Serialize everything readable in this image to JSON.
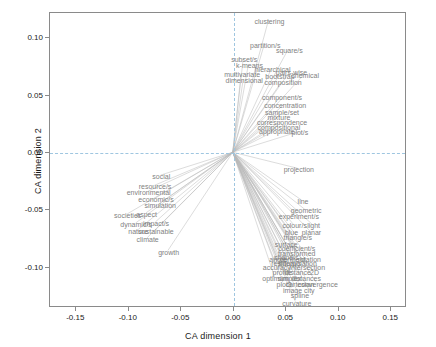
{
  "chart_data": {
    "type": "scatter",
    "title": "",
    "xlabel": "CA dimension 1",
    "ylabel": "CA dimension 2",
    "xlim": [
      -0.175,
      0.165
    ],
    "ylim": [
      -0.135,
      0.122
    ],
    "xticks": [
      "-0.15",
      "-0.10",
      "-0.05",
      "0.00",
      "0.05",
      "0.10",
      "0.15"
    ],
    "xtick_values": [
      -0.15,
      -0.1,
      -0.05,
      0.0,
      0.05,
      0.1,
      0.15
    ],
    "yticks": [
      "-0.10",
      "-0.05",
      "0.00",
      "0.05",
      "0.10"
    ],
    "ytick_values": [
      -0.1,
      -0.05,
      0.0,
      0.05,
      0.1
    ],
    "grid": "dashed-at-zero",
    "legend": "none",
    "origin": [
      0.0,
      0.0
    ],
    "points": [
      {
        "label": "clustering",
        "x": 0.034,
        "y": 0.115
      },
      {
        "label": "partition/s",
        "x": 0.03,
        "y": 0.094
      },
      {
        "label": "square/s",
        "x": 0.053,
        "y": 0.09
      },
      {
        "label": "subset/s",
        "x": 0.01,
        "y": 0.082
      },
      {
        "label": "k-means",
        "x": 0.015,
        "y": 0.077
      },
      {
        "label": "hierarchical",
        "x": 0.037,
        "y": 0.073
      },
      {
        "label": "pairs-wise",
        "x": 0.055,
        "y": 0.071
      },
      {
        "label": "multivariate",
        "x": 0.008,
        "y": 0.069
      },
      {
        "label": "bootstrap",
        "x": 0.044,
        "y": 0.067
      },
      {
        "label": "chemical",
        "x": 0.068,
        "y": 0.068
      },
      {
        "label": "dimensional",
        "x": 0.01,
        "y": 0.064
      },
      {
        "label": "composition",
        "x": 0.047,
        "y": 0.062
      },
      {
        "label": "component/s",
        "x": 0.046,
        "y": 0.049
      },
      {
        "label": "concentration",
        "x": 0.049,
        "y": 0.042
      },
      {
        "label": "sample/set",
        "x": 0.046,
        "y": 0.036
      },
      {
        "label": "mixture",
        "x": 0.043,
        "y": 0.031
      },
      {
        "label": "correspondence",
        "x": 0.046,
        "y": 0.027
      },
      {
        "label": "compositional",
        "x": 0.043,
        "y": 0.023
      },
      {
        "label": "appropriate",
        "x": 0.041,
        "y": 0.019
      },
      {
        "label": "plot/s",
        "x": 0.063,
        "y": 0.018
      },
      {
        "label": "projection",
        "x": 0.062,
        "y": -0.014
      },
      {
        "label": "social",
        "x": -0.069,
        "y": -0.02
      },
      {
        "label": "resource/s",
        "x": -0.075,
        "y": -0.029
      },
      {
        "label": "environmental",
        "x": -0.081,
        "y": -0.034
      },
      {
        "label": "economic/s",
        "x": -0.074,
        "y": -0.04
      },
      {
        "label": "simulation",
        "x": -0.07,
        "y": -0.045
      },
      {
        "label": "line",
        "x": 0.066,
        "y": -0.042
      },
      {
        "label": "geometric",
        "x": 0.069,
        "y": -0.05
      },
      {
        "label": "experiment/s",
        "x": 0.062,
        "y": -0.055
      },
      {
        "label": "societies",
        "x": -0.101,
        "y": -0.054
      },
      {
        "label": "aspect",
        "x": -0.083,
        "y": -0.053
      },
      {
        "label": "dynamic/s",
        "x": -0.093,
        "y": -0.062
      },
      {
        "label": "impact/s",
        "x": -0.074,
        "y": -0.061
      },
      {
        "label": "colour/s",
        "x": 0.058,
        "y": -0.063
      },
      {
        "label": "light",
        "x": 0.076,
        "y": -0.063
      },
      {
        "label": "nature",
        "x": -0.091,
        "y": -0.068
      },
      {
        "label": "sustainable",
        "x": -0.074,
        "y": -0.068
      },
      {
        "label": "blue",
        "x": 0.055,
        "y": -0.069
      },
      {
        "label": "planar",
        "x": 0.074,
        "y": -0.069
      },
      {
        "label": "triangle/s",
        "x": 0.061,
        "y": -0.073
      },
      {
        "label": "climate",
        "x": -0.082,
        "y": -0.075
      },
      {
        "label": "surface",
        "x": 0.05,
        "y": -0.079
      },
      {
        "label": "coefficient/s",
        "x": 0.06,
        "y": -0.083
      },
      {
        "label": "growth",
        "x": -0.062,
        "y": -0.086
      },
      {
        "label": "transformed",
        "x": 0.06,
        "y": -0.087
      },
      {
        "label": "shape/s",
        "x": 0.05,
        "y": -0.091
      },
      {
        "label": "angle",
        "x": 0.042,
        "y": -0.092
      },
      {
        "label": "centre/d",
        "x": 0.056,
        "y": -0.092
      },
      {
        "label": "rotation",
        "x": 0.072,
        "y": -0.092
      },
      {
        "label": "residual/s",
        "x": 0.05,
        "y": -0.096
      },
      {
        "label": "interpolation",
        "x": 0.061,
        "y": -0.096
      },
      {
        "label": "accuracy",
        "x": 0.041,
        "y": -0.099
      },
      {
        "label": "intersection",
        "x": 0.07,
        "y": -0.099
      },
      {
        "label": "profile",
        "x": 0.046,
        "y": -0.104
      },
      {
        "label": "distance",
        "x": 0.061,
        "y": -0.104
      },
      {
        "label": "2D",
        "x": 0.077,
        "y": -0.104
      },
      {
        "label": "optimum",
        "x": 0.04,
        "y": -0.109
      },
      {
        "label": "simplex",
        "x": 0.053,
        "y": -0.109
      },
      {
        "label": "distances",
        "x": 0.069,
        "y": -0.109
      },
      {
        "label": "plot3",
        "x": 0.048,
        "y": -0.114
      },
      {
        "label": "cartesian",
        "x": 0.063,
        "y": -0.114
      },
      {
        "label": "convergence",
        "x": 0.08,
        "y": -0.114
      },
      {
        "label": "image",
        "x": 0.056,
        "y": -0.119
      },
      {
        "label": "city",
        "x": 0.072,
        "y": -0.119
      },
      {
        "label": "spline",
        "x": 0.063,
        "y": -0.124
      },
      {
        "label": "curvature",
        "x": 0.06,
        "y": -0.131
      }
    ],
    "rays": {
      "description": "thin grey line segments radiating from origin (0,0) to each point",
      "color": "#b8b8b8"
    }
  }
}
